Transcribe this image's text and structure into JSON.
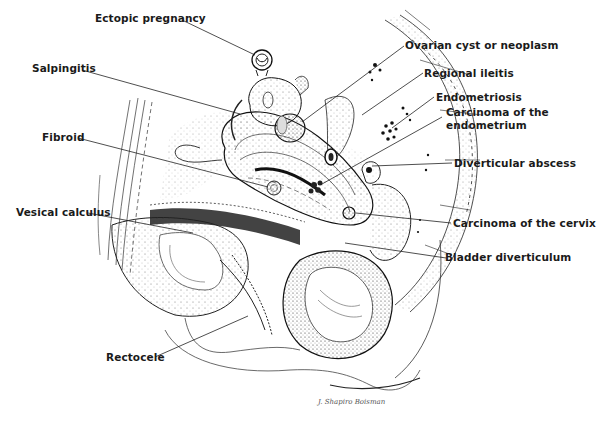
{
  "figure": {
    "labels": {
      "ectopic_pregnancy": "Ectopic pregnancy",
      "salpingitis": "Salpingitis",
      "fibroid": "Fibroid",
      "vesical_calculus": "Vesical calculus",
      "rectocele": "Rectocele",
      "ovarian_cyst": "Ovarian cyst or neoplasm",
      "regional_ileitis": "Regional ileitis",
      "endometriosis": "Endometriosis",
      "carcinoma_endometrium_line1": "Carcinoma of the",
      "carcinoma_endometrium_line2": "endometrium",
      "diverticular_abscess": "Diverticular abscess",
      "carcinoma_cervix": "Carcinoma of the cervix",
      "bladder_diverticulum": "Bladder diverticulum"
    },
    "signature": "J. Shapiro Boisman",
    "colors": {
      "ink": "#1a1a1a",
      "background": "#ffffff",
      "stipple": "#6b6b6b"
    }
  }
}
